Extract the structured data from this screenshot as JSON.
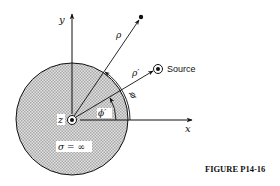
{
  "figure": {
    "caption": "FIGURE P14-16",
    "labels": {
      "y_axis": "y",
      "x_axis": "x",
      "z_axis": "z",
      "rho": "ρ",
      "rho_prime": "ρ′",
      "phi": "ϕ",
      "phi_prime": "ϕ′",
      "source": "Source",
      "conductivity": "σ = ∞"
    }
  },
  "colors": {
    "stroke": "#111111",
    "disc_fill": "#cfcfcf"
  }
}
